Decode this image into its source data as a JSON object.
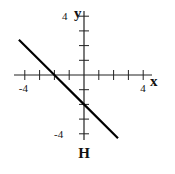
{
  "chart_data": {
    "type": "line",
    "title": "",
    "caption": "H",
    "xlabel": "x",
    "ylabel": "y",
    "xlim": [
      -4.4,
      4.4
    ],
    "ylim": [
      -4.3,
      4.3
    ],
    "x_tick_labels": [
      "-4",
      "4"
    ],
    "y_tick_labels": [
      "4",
      "-4"
    ],
    "x_ticks": [
      -4,
      -3,
      -2,
      -1,
      1,
      2,
      3,
      4
    ],
    "y_ticks": [
      -4,
      -3,
      -2,
      -1,
      1,
      2,
      3,
      4
    ],
    "grid": false,
    "legend": null,
    "series": [
      {
        "name": "line",
        "equation": "y = -x - 2",
        "slope": -1,
        "intercept": -2,
        "x": [
          -4.4,
          -2,
          0,
          2.3
        ],
        "y": [
          2.4,
          0,
          -2,
          -4.3
        ],
        "color": "#000000"
      }
    ]
  }
}
